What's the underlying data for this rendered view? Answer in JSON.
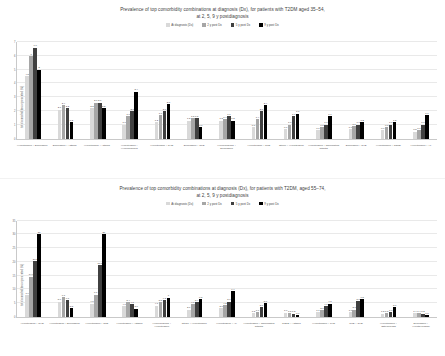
{
  "series_colors": [
    "#d9d9d9",
    "#a6a6a6",
    "#404040",
    "#000000"
  ],
  "legend": [
    {
      "label": "At diagnosis (Dx)"
    },
    {
      "label": "2 y post Dx"
    },
    {
      "label": "5 y post Dx"
    },
    {
      "label": "9 y post Dx"
    }
  ],
  "charts": [
    {
      "id": "chart-top",
      "title_line1": "Prevalence of top comorbidity combinations at diagnosis (Dx), for patients with T2DM aged 35–54,",
      "title_line2": "at 2, 5, 9 y postdiagnosis"
    },
    {
      "id": "chart-bottom",
      "title_line1": "Prevalence of top comorbidity combinations at diagnosis (Dx), for patients with T2DM, aged 55–74,",
      "title_line2": "at 2, 5, 9 y  postdiagnosis"
    }
  ],
  "chart_data": [
    {
      "type": "bar",
      "title": "Prevalence of top comorbidity combinations at diagnosis (Dx), for patients with T2DM aged 35–54, at 2, 5, 9 y postdiagnosis",
      "xlabel": "",
      "ylabel": "total comorbidities represented (%)",
      "ylim": [
        0,
        7
      ],
      "yticks": [
        0,
        1,
        2,
        3,
        4,
        5,
        6,
        7
      ],
      "grid": true,
      "legend_position": "top",
      "categories": [
        "Hypertension + Depression",
        "Depression + Asthma",
        "Hypertension + Asthma",
        "Hypertension + Hyperlipidemia",
        "Hypertension + CHD",
        "Depression + CKD",
        "Hyperlipidemia + Depression",
        "Hypertension + CKD",
        "Stroke + Hypertension",
        "Hypertension + Rheumatoid arthritis",
        "Depression + CHD",
        "Hypertension + COPD",
        "Hypertension + AF"
      ],
      "series": [
        {
          "name": "At diagnosis (Dx)",
          "values": [
            4.5,
            2.1,
            2.2,
            1.0,
            1.2,
            1.3,
            1.3,
            0.8,
            0.7,
            0.6,
            0.7,
            0.6,
            0.5
          ]
        },
        {
          "name": "2 y post Dx",
          "values": [
            6.0,
            2.4,
            2.6,
            1.6,
            1.7,
            1.5,
            1.4,
            1.4,
            1.0,
            0.8,
            0.9,
            0.8,
            0.6
          ]
        },
        {
          "name": "5 y post Dx",
          "values": [
            6.6,
            2.2,
            2.6,
            2.0,
            2.0,
            1.5,
            1.6,
            2.0,
            1.6,
            1.0,
            1.0,
            1.0,
            1.0
          ]
        },
        {
          "name": "9 y post Dx",
          "values": [
            5.0,
            1.2,
            2.2,
            3.4,
            2.5,
            0.8,
            1.3,
            2.4,
            1.8,
            1.6,
            1.2,
            1.2,
            1.7
          ]
        }
      ],
      "labels": [
        [
          "4.5",
          "6",
          "6.6",
          "5"
        ],
        [
          "2.1",
          "2.4",
          "2.2",
          "1.2"
        ],
        [
          "2.2",
          "2.6",
          "2.6",
          "2.2"
        ],
        [
          "1.0",
          "1.6",
          "2.0",
          "3.4"
        ],
        [
          "1.2",
          "1.7",
          "2.0",
          "2.5"
        ],
        [
          "1.3",
          "1.5",
          "1.5",
          "0.8"
        ],
        [
          "1.3",
          "1.4",
          "1.6",
          "1.3"
        ],
        [
          "0.8",
          "1.4",
          "2.0",
          "2.4"
        ],
        [
          "0.7",
          "1.0",
          "1.6",
          "1.8"
        ],
        [
          "0.6",
          "0.8",
          "1.0",
          "1.6"
        ],
        [
          "0.7",
          "0.9",
          "1.0",
          "1.2"
        ],
        [
          "0.6",
          "0.8",
          "1.0",
          "1.2"
        ],
        [
          "0.5",
          "0.6",
          "1.0",
          "1.7"
        ]
      ]
    },
    {
      "type": "bar",
      "title": "Prevalence of top comorbidity combinations at diagnosis (Dx), for patients with T2DM, aged 55–74, at 2, 5, 9 y postdiagnosis",
      "xlabel": "",
      "ylabel": "total comorbidities represented (%)",
      "ylim": [
        0,
        35
      ],
      "yticks": [
        0,
        5,
        10,
        15,
        20,
        25,
        30,
        35
      ],
      "grid": true,
      "legend_position": "top",
      "categories": [
        "Hypertension + CHD",
        "Hypertension + Depression",
        "Hypertension + CKD",
        "Hypertension + Asthma",
        "Hyperlipidemia + Hypertension",
        "Stroke + Hypertension",
        "Hypertension + AF",
        "Hypertension + Rheumatoid arthritis",
        "COPD + Asthma",
        "Hypertension + PVD",
        "CKD + CHD",
        "Hypertension + Osteoporosis",
        "Depression + Hypothyroidism"
      ],
      "series": [
        {
          "name": "At diagnosis (Dx)",
          "values": [
            7.9,
            5.6,
            4.8,
            4.0,
            4.1,
            2.7,
            3.1,
            1.3,
            1.6,
            1.7,
            1.7,
            1.2,
            1.4
          ]
        },
        {
          "name": "2 y post Dx",
          "values": [
            14.6,
            7.1,
            8.1,
            5.4,
            5.5,
            4.6,
            4.2,
            1.7,
            1.5,
            2.6,
            2.7,
            1.5,
            1.4
          ]
        },
        {
          "name": "5 y post Dx",
          "values": [
            20.2,
            6.1,
            18.8,
            4.7,
            6.2,
            5.4,
            5.6,
            3.6,
            1.2,
            4.0,
            5.8,
            1.8,
            1.2
          ]
        },
        {
          "name": "9 y post Dx",
          "values": [
            30.0,
            3.3,
            30.0,
            3.0,
            7.0,
            6.5,
            9.4,
            5.0,
            0.6,
            4.8,
            6.5,
            3.7,
            0.8
          ]
        }
      ],
      "labels": [
        [
          "7.9",
          "14.6",
          "20.2",
          "30"
        ],
        [
          "5.6",
          "7.1",
          "6.1",
          "3.3"
        ],
        [
          "4.8",
          "8.1",
          "18.8",
          "30"
        ],
        [
          "4.0",
          "5.4",
          "4.7",
          "3.0"
        ],
        [
          "4.1",
          "5.5",
          "6.2",
          "7"
        ],
        [
          "2.7",
          "4.6",
          "5.4",
          "6.5"
        ],
        [
          "3.1",
          "4.2",
          "5.6",
          "9.4"
        ],
        [
          "1.3",
          "1.7",
          "3.6",
          "5.0"
        ],
        [
          "1.6",
          "1.5",
          "1.2",
          "0.6"
        ],
        [
          "1.7",
          "2.6",
          "4.0",
          "4.8"
        ],
        [
          "1.7",
          "2.7",
          "5.8",
          "6.5"
        ],
        [
          "1.2",
          "1.5",
          "1.8",
          "3.7"
        ],
        [
          "1.4",
          "1.4",
          "1.2",
          "0.8"
        ]
      ]
    }
  ]
}
